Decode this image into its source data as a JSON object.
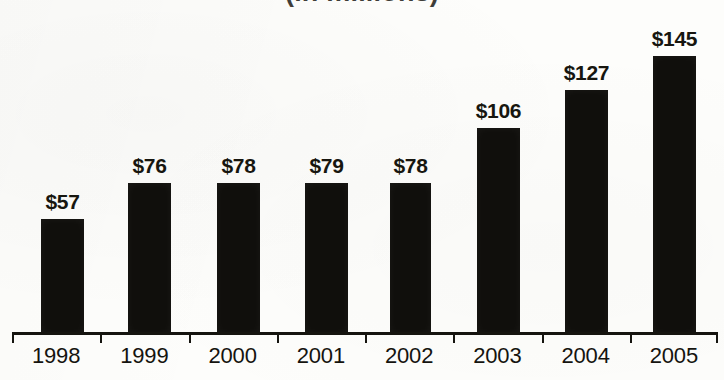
{
  "chart_data": {
    "type": "bar",
    "title": "(in millions)",
    "title_truncated": true,
    "subtitle": "",
    "xlabel": "",
    "ylabel": "",
    "categories": [
      "1998",
      "1999",
      "2000",
      "2001",
      "2002",
      "2003",
      "2004",
      "2005"
    ],
    "values": [
      57,
      76,
      78,
      79,
      78,
      106,
      127,
      145
    ],
    "data_labels": [
      "$57",
      "$76",
      "$78",
      "$79",
      "$78",
      "$106",
      "$127",
      "$145"
    ],
    "ylim": [
      0,
      172
    ],
    "grid": false,
    "legend": false,
    "legend_position": "none",
    "bar_color": "#100f0c",
    "background_color": "#fdfdfb",
    "axis_color": "#15140f",
    "label_color": "#17160f"
  },
  "axis": {
    "tick_count": 9,
    "baseline_visible": true
  },
  "bars": [
    {
      "label": "$57",
      "category": "1998",
      "value": 57,
      "left": 41,
      "width": 43,
      "height": 115
    },
    {
      "label": "$76",
      "category": "1999",
      "value": 76,
      "left": 128,
      "width": 43,
      "height": 151
    },
    {
      "label": "$78",
      "category": "2000",
      "value": 78,
      "left": 217,
      "width": 43,
      "height": 151
    },
    {
      "label": "$79",
      "category": "2001",
      "value": 79,
      "left": 305,
      "width": 43,
      "height": 151
    },
    {
      "label": "$78",
      "category": "2002",
      "value": 78,
      "left": 390,
      "width": 41,
      "height": 151
    },
    {
      "label": "$106",
      "category": "2003",
      "value": 106,
      "left": 477,
      "width": 43,
      "height": 206
    },
    {
      "label": "$127",
      "category": "2004",
      "value": 127,
      "left": 565,
      "width": 43,
      "height": 244
    },
    {
      "label": "$145",
      "category": "2005",
      "value": 145,
      "left": 653,
      "width": 43,
      "height": 278
    }
  ]
}
